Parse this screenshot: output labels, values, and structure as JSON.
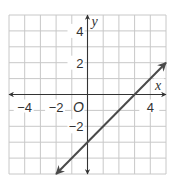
{
  "chart_data": {
    "type": "line",
    "title": "",
    "xlabel": "x",
    "ylabel": "y",
    "origin_label": "O",
    "xlim": [
      -5,
      5
    ],
    "ylim": [
      -5,
      5
    ],
    "grid": true,
    "grid_step": 1,
    "x_tick_labels": [
      {
        "value": -4,
        "label": "−4"
      },
      {
        "value": -2,
        "label": "−2"
      },
      {
        "value": 4,
        "label": "4"
      }
    ],
    "y_tick_labels": [
      {
        "value": 4,
        "label": "4"
      },
      {
        "value": 2,
        "label": "2"
      },
      {
        "value": -2,
        "label": "−2"
      }
    ],
    "series": [
      {
        "name": "y = x − 3",
        "equation": "y = x - 3",
        "slope": 1,
        "y_intercept": -3,
        "x_intercept": 3,
        "points": [
          [
            -2,
            -5
          ],
          [
            0,
            -3
          ],
          [
            3,
            0
          ],
          [
            5,
            2
          ]
        ],
        "arrows_both_ends": true
      }
    ],
    "colors": {
      "grid": "#c8c8c8",
      "axes": "#333333",
      "line": "#4a4a4a"
    }
  }
}
